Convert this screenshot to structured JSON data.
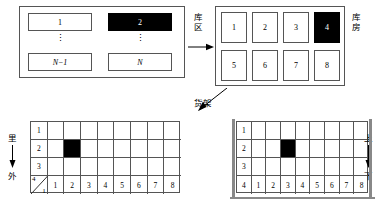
{
  "diagram": {
    "zone_panel": {
      "name": "warehouse-zone-panel",
      "cells": [
        {
          "label": "1",
          "filled": false,
          "italic": false
        },
        {
          "label": "2",
          "filled": true,
          "italic": false
        },
        {
          "label": "N−1",
          "filled": false,
          "italic": true
        },
        {
          "label": "N",
          "filled": false,
          "italic": true
        }
      ],
      "ellipsis": "⋮"
    },
    "arrow_zone_label": "库区",
    "warehouse": {
      "name": "warehouse-room-grid",
      "label": "库房",
      "rooms": [
        {
          "label": "1",
          "filled": false
        },
        {
          "label": "2",
          "filled": false
        },
        {
          "label": "3",
          "filled": false
        },
        {
          "label": "4",
          "filled": true
        },
        {
          "label": "5",
          "filled": false
        },
        {
          "label": "6",
          "filled": false
        },
        {
          "label": "7",
          "filled": false
        },
        {
          "label": "8",
          "filled": false
        }
      ]
    },
    "arrow_rack_label": "货架",
    "grid_left": {
      "name": "rack-front-view-grid",
      "row_labels": [
        "1",
        "2",
        "3",
        "4"
      ],
      "col_labels": [
        "1",
        "2",
        "3",
        "4",
        "5",
        "6",
        "7",
        "8"
      ],
      "corner_top_label": "4",
      "corner_bottom_label": "1",
      "filled_cell": {
        "row": 2,
        "col": 2
      },
      "direction": {
        "top": "里",
        "bottom": "外",
        "arrow": "↓"
      }
    },
    "grid_right": {
      "name": "rack-side-view-grid",
      "row_labels": [
        "1",
        "2",
        "3",
        "4"
      ],
      "col_labels": [
        "1",
        "2",
        "3",
        "4",
        "5",
        "6",
        "7",
        "8"
      ],
      "filled_cell": {
        "row": 2,
        "col": 3
      },
      "direction": {
        "top": "上",
        "bottom": "下",
        "arrow": "↓"
      }
    }
  }
}
